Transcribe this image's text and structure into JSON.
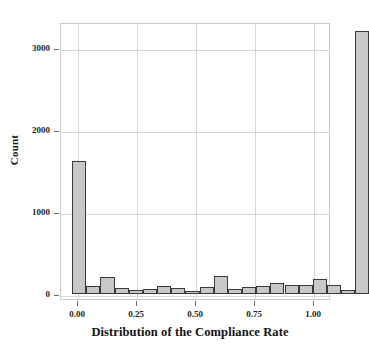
{
  "chart_data": {
    "type": "bar",
    "subtype": "histogram",
    "title": "",
    "xlabel": "Distribution of the Compliance Rate",
    "ylabel": "Count",
    "xlim": [
      -0.035,
      1.06
    ],
    "ylim": [
      0,
      3320
    ],
    "grid": true,
    "legend": null,
    "bin_width": 0.06,
    "bar_fill_color": "#c8c8c8",
    "bar_edge_color": "#3a3a3a",
    "axis_color": "#c9c9c9",
    "grid_color": "#d6d6d6",
    "xticks": [
      0.0,
      0.25,
      0.5,
      0.75,
      1.0
    ],
    "xtick_labels": [
      "0.00",
      "0.25",
      "0.50",
      "0.75",
      "1.00"
    ],
    "yticks": [
      0,
      1000,
      2000,
      3000
    ],
    "ytick_labels": [
      "0",
      "1000",
      "2000",
      "3000"
    ],
    "bins": [
      {
        "center": 0.025,
        "left": 0.0,
        "right": 0.055,
        "value": 1625
      },
      {
        "center": 0.085,
        "left": 0.055,
        "right": 0.115,
        "value": 95
      },
      {
        "center": 0.145,
        "left": 0.115,
        "right": 0.175,
        "value": 205
      },
      {
        "center": 0.205,
        "left": 0.175,
        "right": 0.235,
        "value": 70
      },
      {
        "center": 0.265,
        "left": 0.235,
        "right": 0.295,
        "value": 50
      },
      {
        "center": 0.325,
        "left": 0.295,
        "right": 0.355,
        "value": 65
      },
      {
        "center": 0.385,
        "left": 0.355,
        "right": 0.415,
        "value": 100
      },
      {
        "center": 0.445,
        "left": 0.415,
        "right": 0.475,
        "value": 75
      },
      {
        "center": 0.505,
        "left": 0.475,
        "right": 0.535,
        "value": 40
      },
      {
        "center": 0.565,
        "left": 0.535,
        "right": 0.595,
        "value": 90
      },
      {
        "center": 0.625,
        "left": 0.595,
        "right": 0.655,
        "value": 215
      },
      {
        "center": 0.685,
        "left": 0.655,
        "right": 0.715,
        "value": 60
      },
      {
        "center": 0.745,
        "left": 0.715,
        "right": 0.775,
        "value": 85
      },
      {
        "center": 0.805,
        "left": 0.775,
        "right": 0.835,
        "value": 95
      },
      {
        "center": 0.865,
        "left": 0.835,
        "right": 0.895,
        "value": 140
      },
      {
        "center": 0.925,
        "left": 0.895,
        "right": 0.955,
        "value": 110
      },
      {
        "center": 0.985,
        "left": 0.955,
        "right": 1.015,
        "value": 115
      },
      {
        "center": 1.045,
        "left": 1.015,
        "right": 1.075,
        "value": 185
      },
      {
        "center": 1.105,
        "left": 1.075,
        "right": 1.135,
        "value": 105
      },
      {
        "center": 1.165,
        "left": 1.135,
        "right": 1.195,
        "value": 50
      },
      {
        "center": 1.225,
        "left": 1.195,
        "right": 1.255,
        "value": 3205
      }
    ],
    "values": [
      1625,
      95,
      205,
      70,
      50,
      65,
      100,
      75,
      40,
      90,
      215,
      60,
      85,
      95,
      140,
      110,
      115,
      185,
      105,
      50,
      3205
    ]
  }
}
